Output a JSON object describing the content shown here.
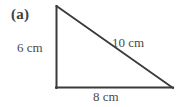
{
  "figure": {
    "part_label": "(a)",
    "shape": "right-triangle",
    "stroke_color": "#3a3a3a",
    "text_color": "#4a4a4a",
    "background_color": "#ffffff",
    "vertices": {
      "apex": [
        56,
        6
      ],
      "bottom_left": [
        56,
        88
      ],
      "bottom_right": [
        173,
        88
      ]
    },
    "sides": [
      {
        "name": "vertical-leg",
        "label": "6 cm",
        "value": 6,
        "unit": "cm"
      },
      {
        "name": "hypotenuse",
        "label": "10 cm",
        "value": 10,
        "unit": "cm"
      },
      {
        "name": "base-leg",
        "label": "8 cm",
        "value": 8,
        "unit": "cm"
      }
    ]
  }
}
